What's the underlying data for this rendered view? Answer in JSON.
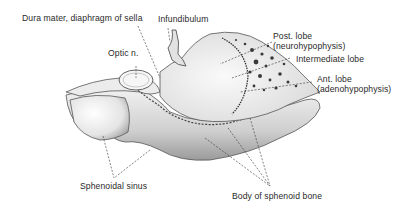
{
  "figure": {
    "labels": {
      "dura": "Dura mater, diaphragm of sella",
      "infundibulum": "Infundibulum",
      "optic": "Optic n.",
      "post_lobe_1": "Post. lobe",
      "post_lobe_2": "(neurohypophysis)",
      "intermediate": "Intermediate lobe",
      "ant_lobe_1": "Ant. lobe",
      "ant_lobe_2": "(adenohypophysis)",
      "sphenoidal_sinus": "Sphenoidal sinus",
      "body_sphenoid": "Body of sphenoid bone"
    }
  }
}
